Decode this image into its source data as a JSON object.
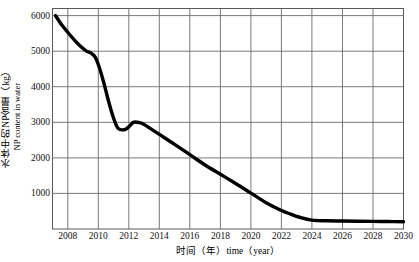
{
  "chart_data": {
    "type": "line",
    "title": "",
    "xlabel": "时间（年）time（year）",
    "ylabel_cn": "水体中的NP含量（kg）",
    "ylabel_en": "NP content in water",
    "xlim": [
      2007,
      2030
    ],
    "ylim": [
      0,
      6200
    ],
    "grid": true,
    "legend": "none",
    "xticks": [
      2008,
      2010,
      2012,
      2014,
      2016,
      2018,
      2020,
      2022,
      2024,
      2026,
      2028,
      2030
    ],
    "yticks": [
      1000,
      2000,
      3000,
      4000,
      5000,
      6000
    ],
    "xtick_labels": [
      "2008",
      "2010",
      "2012",
      "2014",
      "2016",
      "2018",
      "2020",
      "2022",
      "2024",
      "2026",
      "2028",
      "2030"
    ],
    "ytick_labels": [
      "1000",
      "2000",
      "3000",
      "4000",
      "5000",
      "6000"
    ],
    "series": [
      {
        "name": "NP content in water",
        "color": "#000000",
        "x": [
          2007.2,
          2007.6,
          2008.0,
          2008.4,
          2008.8,
          2009.2,
          2009.5,
          2009.8,
          2010.1,
          2010.4,
          2010.7,
          2011.0,
          2011.3,
          2011.7,
          2012.0,
          2012.3,
          2012.7,
          2013.0,
          2013.5,
          2014.0,
          2015.0,
          2016.0,
          2017.0,
          2018.0,
          2019.0,
          2020.0,
          2021.0,
          2022.0,
          2022.6,
          2023.2,
          2024.0,
          2025.0,
          2026.0,
          2027.0,
          2028.0,
          2029.0,
          2030.0
        ],
        "values": [
          6000,
          5740,
          5530,
          5330,
          5150,
          5010,
          4950,
          4830,
          4500,
          4050,
          3550,
          3120,
          2830,
          2790,
          2870,
          3000,
          2990,
          2940,
          2800,
          2660,
          2380,
          2090,
          1800,
          1540,
          1280,
          1010,
          740,
          520,
          420,
          330,
          250,
          230,
          225,
          220,
          215,
          210,
          205
        ]
      }
    ]
  }
}
